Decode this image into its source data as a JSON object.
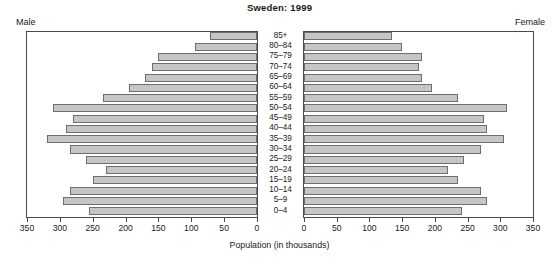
{
  "chart_data": {
    "type": "bar",
    "subtype": "population-pyramid",
    "title": "Sweden: 1999",
    "xlabel": "Population (in thousands)",
    "ylabel": "",
    "grid": false,
    "legend_position": "none",
    "left_panel_label": "Male",
    "right_panel_label": "Female",
    "categories": [
      "85+",
      "80–84",
      "75–79",
      "70–74",
      "65–69",
      "60–64",
      "55–59",
      "50–54",
      "45–49",
      "40–44",
      "35–39",
      "30–34",
      "25–29",
      "20–24",
      "15–19",
      "10–14",
      "5–9",
      "0–4"
    ],
    "series": [
      {
        "name": "Male",
        "side": "left",
        "values": [
          72,
          95,
          150,
          160,
          170,
          195,
          235,
          310,
          280,
          290,
          320,
          285,
          260,
          230,
          250,
          285,
          295,
          255
        ]
      },
      {
        "name": "Female",
        "side": "right",
        "values": [
          135,
          150,
          180,
          175,
          180,
          195,
          235,
          310,
          275,
          280,
          305,
          270,
          245,
          220,
          235,
          270,
          280,
          242
        ]
      }
    ],
    "xlim": [
      0,
      350
    ],
    "left_ticks": [
      350,
      300,
      250,
      200,
      150,
      100,
      50,
      0
    ],
    "right_ticks": [
      0,
      50,
      100,
      150,
      200,
      250,
      300,
      350
    ],
    "bar_fill_color": "#c6c6c6",
    "bar_border_color": "#6e6e6e",
    "frame_color": "#4a4a4a"
  }
}
